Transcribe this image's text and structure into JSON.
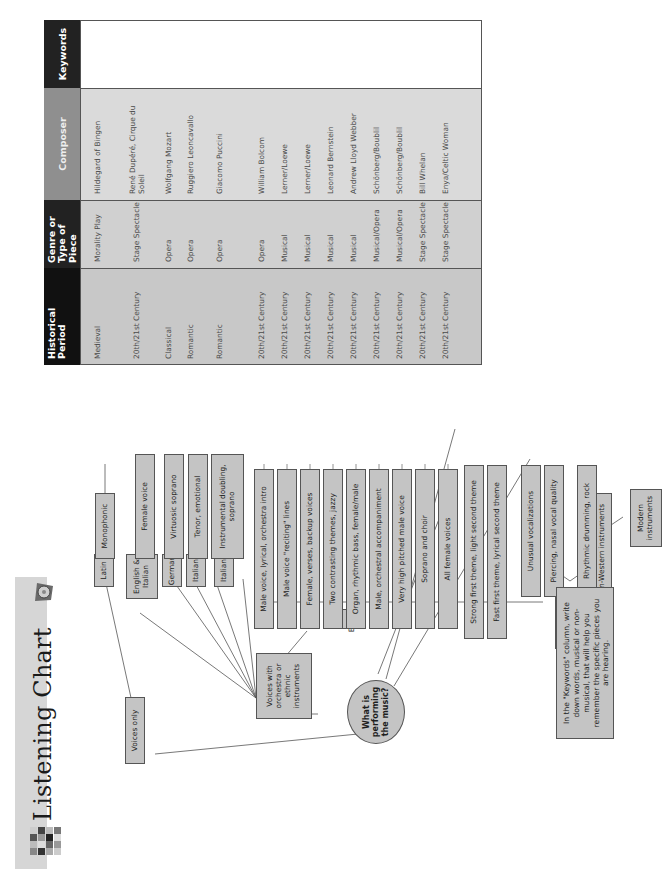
{
  "title": "Listening Chart",
  "root_question": "What is performing the music?",
  "categories": {
    "voices_only": "Voices only",
    "voices_with_orchestra": "Voices with orchestra or ethnic instruments",
    "orchestra": "Orchestra",
    "non_western": "Non-Western instruments",
    "modern": "Modern instruments"
  },
  "languages": {
    "latin": "Latin",
    "english_italian": "English & Italian",
    "german": "German",
    "italian_1": "Italian",
    "italian_2": "Italian",
    "english": "English"
  },
  "descriptors": [
    "Monophonic",
    "Female voice",
    "Virtuosic soprano",
    "Tenor, emotional",
    "Instrumental doubling, soprano",
    "Male voice, lyrical, orchestra intro",
    "Male voice \"reciting\" lines",
    "Female, verses, backup voices",
    "Two contrasting themes, jazzy",
    "Organ, rhythmic bass, female/male",
    "Male, orchestral accompaniment",
    "Very high pitched male voice",
    "Soprano and choir",
    "All female voices",
    "Strong first theme, light second theme",
    "Fast first theme, lyrical second theme",
    "Unusual vocalizations",
    "Piercing, nasal vocal quality",
    "Rhythmic drumming, rock"
  ],
  "note": "In the \"Keywords\" column, write down words, musical or non-musical, that will help you remember the specific pieces you are hearing.",
  "table": {
    "headers": {
      "period": "Historical Period",
      "genre": "Genre or Type of Piece",
      "composer": "Composer",
      "keywords": "Keywords"
    },
    "header_colors": {
      "period": "#111111",
      "genre": "#222222",
      "composer": "#8f8f8f",
      "keywords": "#222222"
    },
    "rows": [
      {
        "period": "Medieval",
        "genre": "Morality Play",
        "composer": "Hildegard of Bingen",
        "keywords": ""
      },
      {
        "period": "20th/21st Century",
        "genre": "Stage Spectacle",
        "composer": "René Dupéré, Cirque du Soleil",
        "keywords": ""
      },
      {
        "period": "Classical",
        "genre": "Opera",
        "composer": "Wolfgang Mozart",
        "keywords": ""
      },
      {
        "period": "Romantic",
        "genre": "Opera",
        "composer": "Ruggiero Leoncavallo",
        "keywords": ""
      },
      {
        "period": "Romantic",
        "genre": "Opera",
        "composer": "Giacomo Puccini",
        "keywords": ""
      },
      {
        "period": "20th/21st Century",
        "genre": "Opera",
        "composer": "William Bolcom",
        "keywords": ""
      },
      {
        "period": "20th/21st Century",
        "genre": "Musical",
        "composer": "Lerner/Loewe",
        "keywords": ""
      },
      {
        "period": "20th/21st Century",
        "genre": "Musical",
        "composer": "Lerner/Loewe",
        "keywords": ""
      },
      {
        "period": "20th/21st Century",
        "genre": "Musical",
        "composer": "Leonard Bernstein",
        "keywords": ""
      },
      {
        "period": "20th/21st Century",
        "genre": "Musical",
        "composer": "Andrew Lloyd Webber",
        "keywords": ""
      },
      {
        "period": "20th/21st Century",
        "genre": "Musical/Opera",
        "composer": "Schönberg/Boublil",
        "keywords": ""
      },
      {
        "period": "20th/21st Century",
        "genre": "Musical/Opera",
        "composer": "Schönberg/Boublil",
        "keywords": ""
      },
      {
        "period": "20th/21st Century",
        "genre": "Stage Spectacle",
        "composer": "Bill Whelan",
        "keywords": ""
      },
      {
        "period": "20th/21st Century",
        "genre": "Stage Spectacle",
        "composer": "Enya/Celtic Woman",
        "keywords": ""
      },
      {
        "period": "Romantic",
        "genre": "Incidental Music",
        "composer": "Georges Bizet",
        "keywords": ""
      },
      {
        "period": "20th/21st Century",
        "genre": "Overture",
        "composer": "Leonard Bernstein",
        "keywords": ""
      },
      {
        "period": "20th/21st Century",
        "genre": "Kabuki Theatre",
        "composer": "Various",
        "keywords": ""
      },
      {
        "period": "20th/21st Century",
        "genre": "Chinese Opera",
        "composer": "Chinese Opera",
        "keywords": ""
      },
      {
        "period": "20th/21st Century",
        "genre": "Stage Spectacle",
        "composer": "Blue Man Group",
        "keywords": ""
      }
    ]
  },
  "colors": {
    "box_fill": "#c4c4c4",
    "table_body": "#d2d2d2",
    "title_bar": "#d6d6d6",
    "border": "#555555"
  }
}
